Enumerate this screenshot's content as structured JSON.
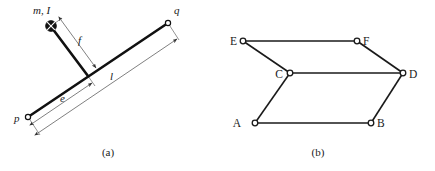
{
  "figure": {
    "width": 435,
    "height": 171,
    "background": "#ffffff",
    "ink_color": "#1a1a1a",
    "thin_color": "#555555",
    "panels": [
      {
        "id": "panel-a",
        "caption": "(a)",
        "caption_pos": {
          "x": 108,
          "y": 156
        },
        "description": "Inclined rigid bar with attached point mass and dimension lines",
        "bar": {
          "from": {
            "x": 28,
            "y": 117
          },
          "to": {
            "x": 168,
            "y": 23
          },
          "stroke_width": 2.6
        },
        "stem": {
          "from": {
            "x": 88,
            "y": 76
          },
          "to": {
            "x": 51,
            "y": 27
          },
          "stroke_width": 2.6
        },
        "mass": {
          "label": "m, I",
          "label_pos": {
            "x": 33,
            "y": 14
          },
          "center": {
            "x": 51,
            "y": 26
          },
          "radius": 5.4,
          "fill": "#111111",
          "hatch": "cross"
        },
        "nodes": [
          {
            "id": "p",
            "label": "p",
            "cx": 28,
            "cy": 117,
            "r": 2.6,
            "label_pos": {
              "x": 14,
              "y": 122
            }
          },
          {
            "id": "q",
            "label": "q",
            "cx": 168,
            "cy": 23,
            "r": 2.6,
            "label_pos": {
              "x": 174,
              "y": 14
            }
          }
        ],
        "dimensions": [
          {
            "id": "dim-f",
            "label": "f",
            "label_pos": {
              "x": 78,
              "y": 44
            },
            "from": {
              "x": 60,
              "y": 20
            },
            "to": {
              "x": 95,
              "y": 68
            },
            "arrow_start": true,
            "arrow_end": true
          },
          {
            "id": "dim-e",
            "label": "e",
            "label_pos": {
              "x": 60,
              "y": 102
            },
            "from": {
              "x": 33,
              "y": 123
            },
            "to": {
              "x": 92,
              "y": 83
            },
            "arrow_start": true,
            "arrow_end": true
          },
          {
            "id": "dim-l",
            "label": "l",
            "label_pos": {
              "x": 110,
              "y": 80
            },
            "from": {
              "x": 38,
              "y": 133
            },
            "to": {
              "x": 177,
              "y": 38
            },
            "arrow_start": true,
            "arrow_end": true
          }
        ],
        "extension_lines": [
          {
            "from": {
              "x": 28,
              "y": 117
            },
            "to": {
              "x": 40,
              "y": 135
            }
          },
          {
            "from": {
              "x": 168,
              "y": 23
            },
            "to": {
              "x": 179,
              "y": 40
            }
          },
          {
            "from": {
              "x": 88,
              "y": 76
            },
            "to": {
              "x": 95,
              "y": 86
            }
          },
          {
            "from": {
              "x": 51,
              "y": 26
            },
            "to": {
              "x": 61,
              "y": 19
            }
          }
        ]
      },
      {
        "id": "panel-b",
        "caption": "(b)",
        "caption_pos": {
          "x": 318,
          "y": 156
        },
        "description": "Graph of six nodes A-F connected by edges",
        "nodes": [
          {
            "id": "A",
            "label": "A",
            "cx": 255,
            "cy": 123,
            "r": 2.8,
            "label_pos": {
              "x": 241,
              "y": 127
            }
          },
          {
            "id": "B",
            "label": "B",
            "cx": 371,
            "cy": 123,
            "r": 2.8,
            "label_pos": {
              "x": 377,
              "y": 127
            }
          },
          {
            "id": "C",
            "label": "C",
            "cx": 290,
            "cy": 73,
            "r": 2.8,
            "label_pos": {
              "x": 275,
              "y": 78
            }
          },
          {
            "id": "D",
            "label": "D",
            "cx": 403,
            "cy": 73,
            "r": 2.8,
            "label_pos": {
              "x": 410,
              "y": 78
            }
          },
          {
            "id": "E",
            "label": "E",
            "cx": 243,
            "cy": 41,
            "r": 2.8,
            "label_pos": {
              "x": 229,
              "y": 45
            }
          },
          {
            "id": "F",
            "label": "F",
            "cx": 357,
            "cy": 41,
            "r": 2.8,
            "label_pos": {
              "x": 363,
              "y": 45
            }
          }
        ],
        "edges": [
          {
            "id": "edge-EF",
            "from": "E",
            "to": "F"
          },
          {
            "id": "edge-EC",
            "from": "E",
            "to": "C"
          },
          {
            "id": "edge-FD",
            "from": "F",
            "to": "D"
          },
          {
            "id": "edge-CD",
            "from": "C",
            "to": "D"
          },
          {
            "id": "edge-CA",
            "from": "C",
            "to": "A"
          },
          {
            "id": "edge-AB",
            "from": "A",
            "to": "B"
          },
          {
            "id": "edge-BD",
            "from": "B",
            "to": "D"
          }
        ],
        "edge_stroke_width": 1.6
      }
    ]
  }
}
